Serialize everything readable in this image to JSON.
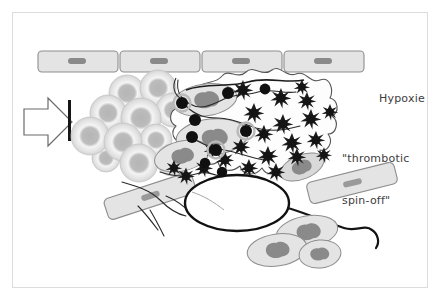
{
  "figure": {
    "domain": "biomedical-schematic",
    "frame": {
      "stroke": "#dcdcdc",
      "fill": "#ffffff"
    },
    "background": "#ffffff"
  },
  "labels": {
    "hypoxia": "Hypoxie",
    "spin_off_line1": "\"thrombotic",
    "spin_off_line2": "spin-off\""
  },
  "palette": {
    "cell_fill": "#e2e2e2",
    "cell_stroke": "#8d8d8d",
    "nucleus_fill": "#8a8a8a",
    "rbc_outer": "#c9c9c9",
    "rbc_ring": "#f2f2f2",
    "rbc_core": "#b5b5b5",
    "platelet": "#1a1a1a",
    "fibrin_stroke": "#4a4a4a",
    "thick_line": "#111111",
    "text": "#3d3d3d",
    "frame": "#dcdcdc"
  },
  "legend_semantics": {
    "arrow": "blood-flow-direction",
    "bar": "flow-obstruction-marker",
    "rbc_cluster": "erythrocyte-aggregate",
    "endothelium_top": "endothelial-cell-lining",
    "fibrin_mesh": "fibrin-network",
    "platelets": "activated-platelets",
    "tumor_cell": "tumor-cell",
    "leukocytes": "leukocytes"
  },
  "elements": {
    "endothelium_top": {
      "count": 4,
      "cells": [
        {
          "x": 38,
          "y": 51,
          "w": 80,
          "h": 21,
          "nucleus_dx": 34,
          "nucleus_dy": 8
        },
        {
          "x": 120,
          "y": 51,
          "w": 80,
          "h": 21,
          "nucleus_dx": 34,
          "nucleus_dy": 8
        },
        {
          "x": 202,
          "y": 51,
          "w": 80,
          "h": 21,
          "nucleus_dx": 34,
          "nucleus_dy": 8
        },
        {
          "x": 284,
          "y": 51,
          "w": 80,
          "h": 21,
          "nucleus_dx": 34,
          "nucleus_dy": 8
        }
      ]
    },
    "endothelium_diagonal": [
      {
        "name": "lower-left-vessel-cell",
        "cx": 150,
        "cy": 196,
        "w": 92,
        "h": 22,
        "rotate": -18
      },
      {
        "name": "right-vessel-cell",
        "cx": 352,
        "cy": 183,
        "w": 90,
        "h": 22,
        "rotate": -14
      }
    ],
    "arrow": {
      "x": 24,
      "y": 98,
      "w": 42,
      "h": 48
    },
    "flow_bar": {
      "x": 68,
      "y": 100,
      "w": 3,
      "h": 40
    },
    "erythrocytes": [
      {
        "cx": 127,
        "cy": 93,
        "r": 18
      },
      {
        "cx": 158,
        "cy": 88,
        "r": 18
      },
      {
        "cx": 108,
        "cy": 113,
        "r": 18
      },
      {
        "cx": 141,
        "cy": 118,
        "r": 20
      },
      {
        "cx": 173,
        "cy": 110,
        "r": 17
      },
      {
        "cx": 90,
        "cy": 136,
        "r": 19
      },
      {
        "cx": 123,
        "cy": 142,
        "r": 19
      },
      {
        "cx": 156,
        "cy": 140,
        "r": 16
      },
      {
        "cx": 139,
        "cy": 163,
        "r": 19
      },
      {
        "cx": 172,
        "cy": 160,
        "r": 16
      },
      {
        "cx": 106,
        "cy": 158,
        "r": 14
      }
    ],
    "leukocytes_embolus": [
      {
        "cx": 205,
        "cy": 100,
        "rx": 32,
        "ry": 16,
        "rotate": -8
      },
      {
        "cx": 212,
        "cy": 137,
        "rx": 36,
        "ry": 18,
        "rotate": -6
      },
      {
        "cx": 182,
        "cy": 156,
        "rx": 28,
        "ry": 15,
        "rotate": -12
      },
      {
        "cx": 300,
        "cy": 166,
        "rx": 22,
        "ry": 12,
        "rotate": -20
      }
    ],
    "leukocytes_free": [
      {
        "cx": 307,
        "cy": 232,
        "rx": 31,
        "ry": 16,
        "rotate": -10
      },
      {
        "cx": 277,
        "cy": 250,
        "rx": 30,
        "ry": 16,
        "rotate": -8
      },
      {
        "cx": 320,
        "cy": 254,
        "rx": 21,
        "ry": 14,
        "rotate": -6
      }
    ],
    "tumor_cell": {
      "cx": 237,
      "cy": 203,
      "rx": 52,
      "ry": 28
    },
    "platelets_star": [
      {
        "cx": 243,
        "cy": 90,
        "r": 7
      },
      {
        "cx": 281,
        "cy": 98,
        "r": 7
      },
      {
        "cx": 307,
        "cy": 101,
        "r": 6
      },
      {
        "cx": 254,
        "cy": 113,
        "r": 7
      },
      {
        "cx": 283,
        "cy": 124,
        "r": 7
      },
      {
        "cx": 311,
        "cy": 119,
        "r": 7
      },
      {
        "cx": 264,
        "cy": 134,
        "r": 6
      },
      {
        "cx": 292,
        "cy": 143,
        "r": 7
      },
      {
        "cx": 316,
        "cy": 140,
        "r": 6
      },
      {
        "cx": 241,
        "cy": 147,
        "r": 6
      },
      {
        "cx": 268,
        "cy": 156,
        "r": 7
      },
      {
        "cx": 297,
        "cy": 157,
        "r": 6
      },
      {
        "cx": 225,
        "cy": 160,
        "r": 6
      },
      {
        "cx": 249,
        "cy": 168,
        "r": 6
      },
      {
        "cx": 276,
        "cy": 172,
        "r": 6
      },
      {
        "cx": 204,
        "cy": 168,
        "r": 6
      },
      {
        "cx": 186,
        "cy": 176,
        "r": 6
      },
      {
        "cx": 174,
        "cy": 168,
        "r": 5
      },
      {
        "cx": 212,
        "cy": 150,
        "r": 5
      },
      {
        "cx": 330,
        "cy": 112,
        "r": 5
      },
      {
        "cx": 302,
        "cy": 87,
        "r": 5
      },
      {
        "cx": 324,
        "cy": 155,
        "r": 5
      }
    ],
    "platelets_round": [
      {
        "cx": 182,
        "cy": 103,
        "r": 6,
        "halo": true
      },
      {
        "cx": 195,
        "cy": 120,
        "r": 6,
        "halo": false
      },
      {
        "cx": 192,
        "cy": 137,
        "r": 6,
        "halo": false
      },
      {
        "cx": 216,
        "cy": 150,
        "r": 6,
        "halo": true
      },
      {
        "cx": 228,
        "cy": 93,
        "r": 6,
        "halo": false
      },
      {
        "cx": 246,
        "cy": 131,
        "r": 6,
        "halo": true
      },
      {
        "cx": 265,
        "cy": 89,
        "r": 5,
        "halo": false
      },
      {
        "cx": 205,
        "cy": 163,
        "r": 5,
        "halo": false
      },
      {
        "cx": 222,
        "cy": 172,
        "r": 5,
        "halo": false
      }
    ]
  }
}
